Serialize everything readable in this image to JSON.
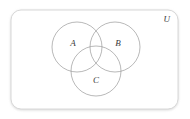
{
  "figure": {
    "kind": "venn-diagram",
    "universe": {
      "label": "U",
      "border_color": "#d8d8d8",
      "fill_color": "#ffffff"
    },
    "circle_color": "#9a9a9a",
    "label_color": "#3a3a3a",
    "background_color": "#ffffff",
    "sets": [
      {
        "id": "A",
        "label": "A",
        "cx": 77,
        "cy": 47,
        "r": 25,
        "label_x": 73,
        "label_y": 46
      },
      {
        "id": "B",
        "label": "B",
        "cx": 115,
        "cy": 47,
        "r": 25,
        "label_x": 118,
        "label_y": 46
      },
      {
        "id": "C",
        "label": "C",
        "cx": 96,
        "cy": 71,
        "r": 25,
        "label_x": 96,
        "label_y": 83
      }
    ],
    "frame": {
      "x": 11,
      "y": 10,
      "width": 167,
      "height": 99,
      "radius": 10
    }
  }
}
